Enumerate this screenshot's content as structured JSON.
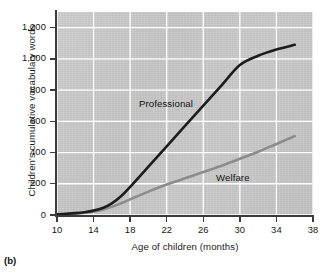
{
  "panel": {
    "label": "(b)"
  },
  "chart_data": {
    "type": "line",
    "title": "",
    "xlabel": "Age of children (months)",
    "ylabel": "Children's cumulative vocabulary words",
    "xlim": [
      10,
      38
    ],
    "ylim": [
      0,
      1300
    ],
    "grid": true,
    "grid_color": "#ffffff",
    "plot_background": "#c8c8c8",
    "legend_position": "inline-annotations",
    "xticks": [
      10,
      14,
      18,
      22,
      26,
      30,
      34,
      38
    ],
    "xtick_labels": [
      "10",
      "14",
      "18",
      "22",
      "26",
      "30",
      "34",
      "38"
    ],
    "yticks": [
      0,
      200,
      400,
      600,
      800,
      1000,
      1200
    ],
    "ytick_labels": [
      "0",
      "200",
      "400",
      "600",
      "800",
      "1,000",
      "1,200"
    ],
    "x": [
      10,
      11,
      12,
      13,
      14,
      15,
      16,
      17,
      18,
      20,
      22,
      24,
      26,
      28,
      30,
      32,
      34,
      36
    ],
    "series": [
      {
        "name": "Professional",
        "color": "#1c1c1c",
        "width": 2.6,
        "annotation": "Professional",
        "values": [
          5,
          8,
          12,
          18,
          28,
          45,
          75,
          120,
          180,
          310,
          440,
          570,
          700,
          830,
          960,
          1020,
          1060,
          1090
        ]
      },
      {
        "name": "Welfare",
        "color": "#8c8c8c",
        "width": 2.6,
        "annotation": "Welfare",
        "values": [
          4,
          6,
          9,
          14,
          22,
          34,
          52,
          75,
          100,
          150,
          195,
          235,
          275,
          315,
          360,
          405,
          455,
          505
        ]
      }
    ]
  }
}
